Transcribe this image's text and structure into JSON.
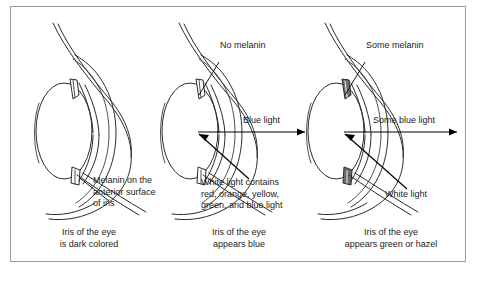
{
  "figure": {
    "border_color": "#9a9a9a",
    "background_color": "#ffffff",
    "ink_color": "#2b2b2b"
  },
  "panels": [
    {
      "id": "dark-eye",
      "melanin_label": {
        "name": "melanin-anterior-surface-label",
        "lines": [
          "Melanin on the",
          "anterior surface",
          "of iris"
        ]
      },
      "caption": {
        "name": "caption-dark-eye",
        "lines": [
          "Iris of the eye",
          "is dark colored"
        ]
      },
      "rays": []
    },
    {
      "id": "blue-eye",
      "melanin_label": {
        "name": "no-melanin-label",
        "lines": [
          "No melanin"
        ]
      },
      "caption": {
        "name": "caption-blue-eye",
        "lines": [
          "Iris of the eye",
          "appears blue"
        ]
      },
      "rays": [
        {
          "name": "blue-light-ray-label",
          "text": "Blue light",
          "direction": "outgoing"
        },
        {
          "name": "white-light-ray-label",
          "text": "White light contains",
          "direction": "incoming"
        }
      ],
      "white_light_label": {
        "name": "white-light-composition-label",
        "lines": [
          "White light contains",
          "red, orange, yellow,",
          "green, and blue light"
        ]
      }
    },
    {
      "id": "green-hazel-eye",
      "melanin_label": {
        "name": "some-melanin-label",
        "lines": [
          "Some melanin"
        ]
      },
      "caption": {
        "name": "caption-green-hazel-eye",
        "lines": [
          "Iris of the eye",
          "appears green or hazel"
        ]
      },
      "rays": [
        {
          "name": "some-blue-light-ray-label",
          "text": "Some blue light",
          "direction": "outgoing"
        },
        {
          "name": "white-light-ray-label",
          "text": "White light",
          "direction": "incoming"
        }
      ],
      "white_light_label": {
        "name": "white-light-label",
        "lines": [
          "White light"
        ]
      }
    }
  ],
  "text": {
    "melanin_anterior_l1": "Melanin on the",
    "melanin_anterior_l2": "anterior surface",
    "melanin_anterior_l3": "of iris",
    "caption_dark_l1": "Iris of the eye",
    "caption_dark_l2": "is dark colored",
    "no_melanin": "No melanin",
    "blue_light": "Blue light",
    "white_contains_l1": "White light contains",
    "white_contains_l2": "red, orange, yellow,",
    "white_contains_l3": "green, and blue light",
    "caption_blue_l1": "Iris of the eye",
    "caption_blue_l2": "appears blue",
    "some_melanin": "Some melanin",
    "some_blue_light": "Some blue light",
    "white_light": "White light",
    "caption_green_l1": "Iris of the eye",
    "caption_green_l2": "appears green or hazel"
  }
}
